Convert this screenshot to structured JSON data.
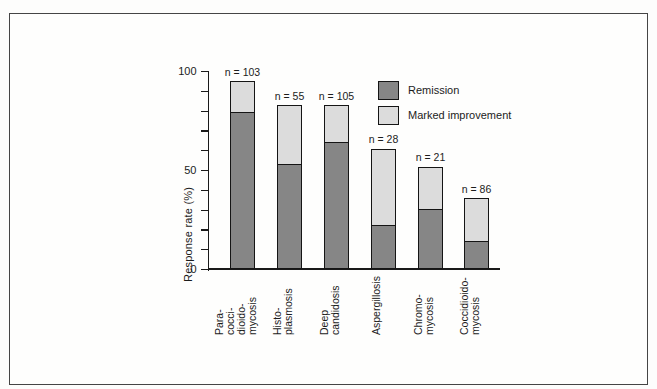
{
  "figure": {
    "background": "#fdfdfc",
    "frame_color": "#454545",
    "outline_color": "#151515",
    "text_color": "#1c1c1c"
  },
  "chart_data": {
    "type": "bar",
    "stacked": true,
    "title": "",
    "xlabel": "",
    "ylabel": "Response rate (%)",
    "ylim": [
      0,
      100
    ],
    "ytick_interval": 10,
    "ytick_labeled": [
      0,
      50,
      100
    ],
    "grid": false,
    "legend_position": "top-right",
    "categories": [
      "Paracoccidioidomycosis",
      "Histoplasmosis",
      "Deep candidosis",
      "Aspergillosis",
      "Chromomycosis",
      "Coccidioidomycosis"
    ],
    "category_lines": [
      [
        "Para-",
        "cocci-",
        "dioido-",
        "mycosis"
      ],
      [
        "Histo-",
        "plasmosis"
      ],
      [
        "Deep",
        "candidosis"
      ],
      [
        "Aspergillosis"
      ],
      [
        "Chromo-",
        "mycosis"
      ],
      [
        "Coccidioido-",
        "mycosis"
      ]
    ],
    "n": [
      103,
      55,
      105,
      28,
      21,
      86
    ],
    "n_labels": [
      "n = 103",
      "n = 55",
      "n = 105",
      "n = 28",
      "n = 21",
      "n = 86"
    ],
    "series": [
      {
        "name": "Remission",
        "color": "#868686",
        "values": [
          79,
          53,
          64,
          22,
          30,
          14
        ]
      },
      {
        "name": "Marked improvement",
        "color": "#dcdcdc",
        "values": [
          16,
          30,
          19,
          39,
          22,
          22
        ]
      }
    ],
    "totals": [
      95,
      83,
      83,
      61,
      52,
      36
    ]
  }
}
